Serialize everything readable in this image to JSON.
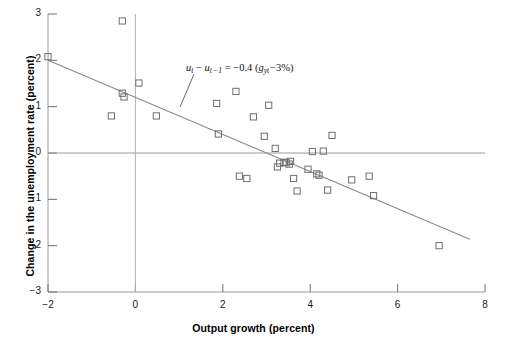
{
  "chart_data": {
    "type": "scatter",
    "title": "",
    "xlabel": "Output growth (percent)",
    "ylabel": "Change in the unemployment rate (percent)",
    "xlim": [
      -2,
      8
    ],
    "ylim": [
      -3,
      3
    ],
    "xticks": [
      -2,
      0,
      2,
      4,
      6,
      8
    ],
    "yticks": [
      3,
      2,
      1,
      0,
      -1,
      -2,
      -3
    ],
    "xtick_labels": [
      "−2",
      "0",
      "2",
      "4",
      "6",
      "8"
    ],
    "ytick_labels": [
      "3",
      "2",
      "1",
      "0",
      "−1",
      "−2",
      "−3"
    ],
    "grid": false,
    "legend": null,
    "marker": "open-square",
    "marker_color": "#6e6e6e",
    "series": [
      {
        "name": "Okun's law observations",
        "points": [
          [
            -2.0,
            2.08
          ],
          [
            -0.55,
            0.8
          ],
          [
            -0.3,
            2.85
          ],
          [
            -0.3,
            1.29
          ],
          [
            -0.26,
            1.21
          ],
          [
            0.08,
            1.51
          ],
          [
            0.48,
            0.8
          ],
          [
            1.86,
            1.07
          ],
          [
            1.9,
            0.41
          ],
          [
            2.3,
            1.33
          ],
          [
            2.38,
            -0.5
          ],
          [
            2.55,
            -0.55
          ],
          [
            2.7,
            0.78
          ],
          [
            2.95,
            0.36
          ],
          [
            3.05,
            1.03
          ],
          [
            3.2,
            0.1
          ],
          [
            3.25,
            -0.3
          ],
          [
            3.3,
            -0.22
          ],
          [
            3.4,
            -0.2
          ],
          [
            3.45,
            -0.21
          ],
          [
            3.52,
            -0.24
          ],
          [
            3.55,
            -0.18
          ],
          [
            3.62,
            -0.55
          ],
          [
            3.7,
            -0.82
          ],
          [
            3.95,
            -0.35
          ],
          [
            4.05,
            0.03
          ],
          [
            4.15,
            -0.45
          ],
          [
            4.2,
            -0.48
          ],
          [
            4.3,
            0.04
          ],
          [
            4.4,
            -0.8
          ],
          [
            4.5,
            0.38
          ],
          [
            4.95,
            -0.58
          ],
          [
            5.35,
            -0.5
          ],
          [
            5.45,
            -0.92
          ],
          [
            6.95,
            -2.0
          ]
        ]
      }
    ],
    "fit_line": {
      "label": "u_t − u_{t−1} = −0.4 (g_yt − 3%)",
      "slope": -0.4,
      "intercept": 1.2,
      "x_start": -2.0,
      "x_end": 7.65,
      "color": "#8a8a8a"
    },
    "annotation": {
      "u_t": "u",
      "sub_t": "t",
      "minus": "−",
      "u_t_prev": "u",
      "sub_t_prev": "t − 1",
      "equals": "=",
      "coefficient": "−0.4",
      "open_paren": "(",
      "g": "g",
      "sub_yt": "yt",
      "three_pct": "−3%",
      "close_paren": ")",
      "full_text": "u_t − u_{t−1} = −0.4 (g_yt −3%)"
    },
    "reference_lines": {
      "horizontal_zero": 0,
      "vertical_zero": 0
    }
  }
}
